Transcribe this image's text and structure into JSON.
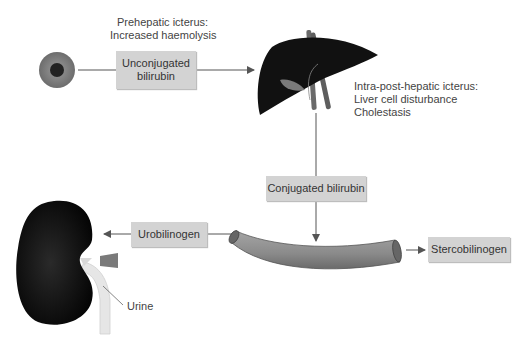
{
  "labels": {
    "prehepatic_line1": "Prehepatic icterus:",
    "prehepatic_line2": "Increased haemolysis",
    "intra_line1": "Intra-post-hepatic icterus:",
    "intra_line2": "Liver cell disturbance",
    "intra_line3": "Cholestasis",
    "urine": "Urine"
  },
  "boxes": {
    "unconjugated_line1": "Unconjugated",
    "unconjugated_line2": "bilirubin",
    "conjugated": "Conjugated bilirubin",
    "urobilinogen": "Urobilinogen",
    "stercobilinogen": "Stercobilinogen"
  },
  "colors": {
    "box_fill": "#d3d3d3",
    "organ_dark": "#111111",
    "arrow": "#555555",
    "intestine": "#8a8a8a"
  }
}
